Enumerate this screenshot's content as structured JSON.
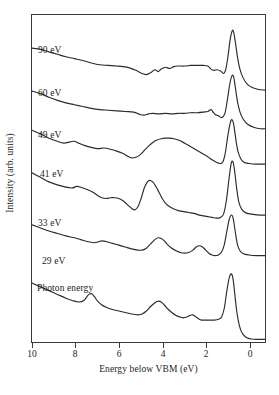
{
  "chart_data": {
    "type": "line",
    "title": "",
    "xlabel": "Energy below VBM (eV)",
    "ylabel": "Intensity (arb. units)",
    "xlim": [
      10,
      -1
    ],
    "x_axis_reversed": true,
    "xticks": [
      10,
      8,
      6,
      4,
      2,
      0
    ],
    "xticklabels": [
      "10",
      "8",
      "6",
      "4",
      "2",
      "0"
    ],
    "yticks": [],
    "yticklabels": [],
    "grid": false,
    "legend": "inline-curve-labels",
    "annotation": "Photon energy",
    "series": [
      {
        "name": "90 eV",
        "label": "90 eV",
        "points": [
          [
            10.0,
            0.72
          ],
          [
            9.6,
            0.7
          ],
          [
            9.2,
            0.66
          ],
          [
            8.8,
            0.62
          ],
          [
            8.4,
            0.58
          ],
          [
            8.0,
            0.55
          ],
          [
            7.6,
            0.52
          ],
          [
            7.2,
            0.48
          ],
          [
            6.8,
            0.45
          ],
          [
            6.4,
            0.44
          ],
          [
            6.0,
            0.43
          ],
          [
            5.7,
            0.42
          ],
          [
            5.4,
            0.4
          ],
          [
            5.1,
            0.36
          ],
          [
            4.8,
            0.31
          ],
          [
            4.6,
            0.29
          ],
          [
            4.4,
            0.32
          ],
          [
            4.2,
            0.37
          ],
          [
            4.05,
            0.34
          ],
          [
            3.9,
            0.38
          ],
          [
            3.7,
            0.41
          ],
          [
            3.5,
            0.39
          ],
          [
            3.3,
            0.42
          ],
          [
            3.1,
            0.43
          ],
          [
            2.8,
            0.43
          ],
          [
            2.5,
            0.44
          ],
          [
            2.2,
            0.44
          ],
          [
            1.9,
            0.44
          ],
          [
            1.7,
            0.43
          ],
          [
            1.55,
            0.38
          ],
          [
            1.4,
            0.36
          ],
          [
            1.25,
            0.37
          ],
          [
            1.1,
            0.35
          ],
          [
            0.95,
            0.31
          ],
          [
            0.85,
            0.38
          ],
          [
            0.75,
            0.58
          ],
          [
            0.65,
            0.85
          ],
          [
            0.55,
            1.0
          ],
          [
            0.48,
            0.98
          ],
          [
            0.4,
            0.82
          ],
          [
            0.3,
            0.58
          ],
          [
            0.2,
            0.4
          ],
          [
            0.05,
            0.25
          ],
          [
            -0.15,
            0.14
          ],
          [
            -0.4,
            0.08
          ],
          [
            -0.7,
            0.05
          ],
          [
            -1.0,
            0.04
          ]
        ]
      },
      {
        "name": "60 eV",
        "label": "60 eV",
        "points": [
          [
            10.0,
            0.7
          ],
          [
            9.6,
            0.66
          ],
          [
            9.2,
            0.6
          ],
          [
            8.8,
            0.55
          ],
          [
            8.4,
            0.51
          ],
          [
            8.0,
            0.48
          ],
          [
            7.6,
            0.45
          ],
          [
            7.2,
            0.42
          ],
          [
            6.8,
            0.4
          ],
          [
            6.4,
            0.39
          ],
          [
            6.0,
            0.38
          ],
          [
            5.6,
            0.37
          ],
          [
            5.2,
            0.36
          ],
          [
            4.9,
            0.32
          ],
          [
            4.7,
            0.31
          ],
          [
            4.5,
            0.33
          ],
          [
            4.3,
            0.34
          ],
          [
            4.0,
            0.33
          ],
          [
            3.7,
            0.34
          ],
          [
            3.4,
            0.33
          ],
          [
            3.1,
            0.34
          ],
          [
            2.8,
            0.34
          ],
          [
            2.5,
            0.35
          ],
          [
            2.2,
            0.35
          ],
          [
            1.9,
            0.36
          ],
          [
            1.7,
            0.37
          ],
          [
            1.55,
            0.4
          ],
          [
            1.45,
            0.36
          ],
          [
            1.35,
            0.32
          ],
          [
            1.2,
            0.3
          ],
          [
            1.05,
            0.27
          ],
          [
            0.9,
            0.33
          ],
          [
            0.78,
            0.55
          ],
          [
            0.66,
            0.82
          ],
          [
            0.56,
            0.95
          ],
          [
            0.48,
            0.93
          ],
          [
            0.4,
            0.76
          ],
          [
            0.3,
            0.53
          ],
          [
            0.18,
            0.36
          ],
          [
            0.02,
            0.24
          ],
          [
            -0.2,
            0.16
          ],
          [
            -0.5,
            0.11
          ],
          [
            -0.8,
            0.09
          ],
          [
            -1.0,
            0.09
          ]
        ]
      },
      {
        "name": "49 eV",
        "label": "49 eV",
        "points": [
          [
            10.0,
            0.76
          ],
          [
            9.6,
            0.7
          ],
          [
            9.2,
            0.63
          ],
          [
            8.8,
            0.58
          ],
          [
            8.5,
            0.55
          ],
          [
            8.2,
            0.57
          ],
          [
            8.0,
            0.58
          ],
          [
            7.8,
            0.55
          ],
          [
            7.5,
            0.51
          ],
          [
            7.2,
            0.48
          ],
          [
            6.9,
            0.46
          ],
          [
            6.6,
            0.47
          ],
          [
            6.3,
            0.45
          ],
          [
            6.0,
            0.42
          ],
          [
            5.7,
            0.38
          ],
          [
            5.5,
            0.34
          ],
          [
            5.3,
            0.31
          ],
          [
            5.1,
            0.32
          ],
          [
            4.9,
            0.36
          ],
          [
            4.7,
            0.43
          ],
          [
            4.5,
            0.5
          ],
          [
            4.3,
            0.56
          ],
          [
            4.1,
            0.6
          ],
          [
            3.9,
            0.62
          ],
          [
            3.7,
            0.63
          ],
          [
            3.5,
            0.63
          ],
          [
            3.3,
            0.62
          ],
          [
            3.1,
            0.6
          ],
          [
            2.9,
            0.57
          ],
          [
            2.7,
            0.53
          ],
          [
            2.5,
            0.49
          ],
          [
            2.3,
            0.45
          ],
          [
            2.1,
            0.41
          ],
          [
            1.9,
            0.37
          ],
          [
            1.7,
            0.33
          ],
          [
            1.5,
            0.28
          ],
          [
            1.3,
            0.24
          ],
          [
            1.15,
            0.22
          ],
          [
            1.0,
            0.24
          ],
          [
            0.88,
            0.38
          ],
          [
            0.76,
            0.66
          ],
          [
            0.64,
            0.88
          ],
          [
            0.56,
            0.93
          ],
          [
            0.48,
            0.86
          ],
          [
            0.38,
            0.62
          ],
          [
            0.28,
            0.42
          ],
          [
            0.15,
            0.3
          ],
          [
            0.0,
            0.24
          ],
          [
            -0.25,
            0.22
          ],
          [
            -0.6,
            0.21
          ],
          [
            -1.0,
            0.21
          ]
        ]
      },
      {
        "name": "41 eV",
        "label": "41 eV",
        "points": [
          [
            10.0,
            0.7
          ],
          [
            9.6,
            0.64
          ],
          [
            9.2,
            0.58
          ],
          [
            8.8,
            0.54
          ],
          [
            8.4,
            0.51
          ],
          [
            8.1,
            0.5
          ],
          [
            7.9,
            0.52
          ],
          [
            7.7,
            0.51
          ],
          [
            7.4,
            0.48
          ],
          [
            7.1,
            0.44
          ],
          [
            6.9,
            0.4
          ],
          [
            6.7,
            0.37
          ],
          [
            6.5,
            0.36
          ],
          [
            6.3,
            0.37
          ],
          [
            6.1,
            0.37
          ],
          [
            5.9,
            0.36
          ],
          [
            5.7,
            0.33
          ],
          [
            5.5,
            0.28
          ],
          [
            5.3,
            0.23
          ],
          [
            5.15,
            0.21
          ],
          [
            5.0,
            0.25
          ],
          [
            4.85,
            0.36
          ],
          [
            4.7,
            0.5
          ],
          [
            4.55,
            0.58
          ],
          [
            4.45,
            0.6
          ],
          [
            4.3,
            0.58
          ],
          [
            4.15,
            0.52
          ],
          [
            4.0,
            0.44
          ],
          [
            3.85,
            0.36
          ],
          [
            3.7,
            0.3
          ],
          [
            3.5,
            0.25
          ],
          [
            3.3,
            0.22
          ],
          [
            3.1,
            0.2
          ],
          [
            2.9,
            0.19
          ],
          [
            2.7,
            0.18
          ],
          [
            2.5,
            0.17
          ],
          [
            2.3,
            0.16
          ],
          [
            2.1,
            0.14
          ],
          [
            1.9,
            0.13
          ],
          [
            1.7,
            0.12
          ],
          [
            1.5,
            0.11
          ],
          [
            1.3,
            0.1
          ],
          [
            1.1,
            0.11
          ],
          [
            0.95,
            0.16
          ],
          [
            0.82,
            0.34
          ],
          [
            0.7,
            0.62
          ],
          [
            0.6,
            0.82
          ],
          [
            0.52,
            0.85
          ],
          [
            0.44,
            0.74
          ],
          [
            0.34,
            0.5
          ],
          [
            0.24,
            0.32
          ],
          [
            0.1,
            0.22
          ],
          [
            -0.1,
            0.17
          ],
          [
            -0.45,
            0.15
          ],
          [
            -0.8,
            0.14
          ],
          [
            -1.0,
            0.14
          ]
        ]
      },
      {
        "name": "33 eV",
        "label": "33 eV",
        "points": [
          [
            10.0,
            0.74
          ],
          [
            9.6,
            0.69
          ],
          [
            9.2,
            0.64
          ],
          [
            8.8,
            0.6
          ],
          [
            8.4,
            0.56
          ],
          [
            8.0,
            0.53
          ],
          [
            7.7,
            0.5
          ],
          [
            7.4,
            0.47
          ],
          [
            7.1,
            0.45
          ],
          [
            6.9,
            0.46
          ],
          [
            6.7,
            0.48
          ],
          [
            6.5,
            0.47
          ],
          [
            6.2,
            0.44
          ],
          [
            5.9,
            0.41
          ],
          [
            5.6,
            0.38
          ],
          [
            5.3,
            0.35
          ],
          [
            5.0,
            0.33
          ],
          [
            4.8,
            0.33
          ],
          [
            4.6,
            0.36
          ],
          [
            4.4,
            0.43
          ],
          [
            4.2,
            0.5
          ],
          [
            4.05,
            0.53
          ],
          [
            3.9,
            0.52
          ],
          [
            3.75,
            0.48
          ],
          [
            3.6,
            0.42
          ],
          [
            3.4,
            0.36
          ],
          [
            3.2,
            0.32
          ],
          [
            3.0,
            0.29
          ],
          [
            2.8,
            0.28
          ],
          [
            2.6,
            0.29
          ],
          [
            2.4,
            0.33
          ],
          [
            2.25,
            0.38
          ],
          [
            2.1,
            0.4
          ],
          [
            1.95,
            0.38
          ],
          [
            1.8,
            0.33
          ],
          [
            1.65,
            0.28
          ],
          [
            1.5,
            0.25
          ],
          [
            1.35,
            0.24
          ],
          [
            1.2,
            0.25
          ],
          [
            1.05,
            0.3
          ],
          [
            0.92,
            0.42
          ],
          [
            0.8,
            0.64
          ],
          [
            0.68,
            0.84
          ],
          [
            0.58,
            0.9
          ],
          [
            0.5,
            0.84
          ],
          [
            0.4,
            0.62
          ],
          [
            0.3,
            0.42
          ],
          [
            0.18,
            0.32
          ],
          [
            0.02,
            0.27
          ],
          [
            -0.25,
            0.25
          ],
          [
            -0.6,
            0.24
          ],
          [
            -1.0,
            0.24
          ]
        ]
      },
      {
        "name": "29 eV",
        "label": "29 eV",
        "points": [
          [
            10.0,
            0.78
          ],
          [
            9.6,
            0.73
          ],
          [
            9.2,
            0.68
          ],
          [
            8.8,
            0.63
          ],
          [
            8.4,
            0.58
          ],
          [
            8.1,
            0.55
          ],
          [
            7.8,
            0.53
          ],
          [
            7.55,
            0.55
          ],
          [
            7.35,
            0.62
          ],
          [
            7.2,
            0.64
          ],
          [
            7.05,
            0.6
          ],
          [
            6.9,
            0.54
          ],
          [
            6.7,
            0.49
          ],
          [
            6.5,
            0.46
          ],
          [
            6.2,
            0.43
          ],
          [
            5.9,
            0.41
          ],
          [
            5.6,
            0.39
          ],
          [
            5.3,
            0.37
          ],
          [
            5.0,
            0.36
          ],
          [
            4.8,
            0.37
          ],
          [
            4.6,
            0.41
          ],
          [
            4.4,
            0.47
          ],
          [
            4.2,
            0.52
          ],
          [
            4.05,
            0.54
          ],
          [
            3.9,
            0.53
          ],
          [
            3.75,
            0.49
          ],
          [
            3.6,
            0.44
          ],
          [
            3.4,
            0.39
          ],
          [
            3.2,
            0.35
          ],
          [
            3.0,
            0.33
          ],
          [
            2.85,
            0.32
          ],
          [
            2.7,
            0.33
          ],
          [
            2.55,
            0.35
          ],
          [
            2.42,
            0.36
          ],
          [
            2.3,
            0.34
          ],
          [
            2.15,
            0.31
          ],
          [
            2.0,
            0.29
          ],
          [
            1.8,
            0.29
          ],
          [
            1.6,
            0.29
          ],
          [
            1.4,
            0.29
          ],
          [
            1.2,
            0.3
          ],
          [
            1.05,
            0.33
          ],
          [
            0.92,
            0.45
          ],
          [
            0.8,
            0.68
          ],
          [
            0.68,
            0.86
          ],
          [
            0.58,
            0.9
          ],
          [
            0.5,
            0.82
          ],
          [
            0.42,
            0.62
          ],
          [
            0.34,
            0.42
          ],
          [
            0.26,
            0.28
          ],
          [
            0.16,
            0.17
          ],
          [
            0.04,
            0.1
          ],
          [
            -0.12,
            0.06
          ],
          [
            -0.35,
            0.04
          ],
          [
            -0.65,
            0.035
          ],
          [
            -1.0,
            0.035
          ]
        ]
      }
    ]
  },
  "labels": {
    "ylabel": "Intensity (arb. units)",
    "xlabel": "Energy below VBM (eV)",
    "annotation": "Photon energy",
    "curve_labels": [
      "90 eV",
      "60 eV",
      "49 eV",
      "41 eV",
      "33 eV",
      "29 eV"
    ],
    "xticklabels": [
      "10",
      "8",
      "6",
      "4",
      "2",
      "0"
    ]
  },
  "style": {
    "line_color": "#2b2b2b",
    "frame_color": "#3a3a3a",
    "background": "#ffffff",
    "text_color": "#1d1d1d"
  }
}
